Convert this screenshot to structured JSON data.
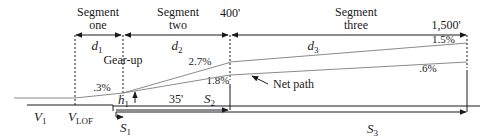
{
  "diagram": {
    "segments": [
      {
        "name": "Segment one",
        "line1": "Segment",
        "line2": "one",
        "distance": "d",
        "distance_sub": "1"
      },
      {
        "name": "Segment two",
        "line1": "Segment",
        "line2": "two",
        "distance": "d",
        "distance_sub": "2"
      },
      {
        "name": "Segment three",
        "line1": "Segment",
        "line2": "three",
        "distance": "d",
        "distance_sub": "3"
      }
    ],
    "altitudes": {
      "end_segment_two": "400'",
      "end_segment_three": "1,500'",
      "screen_height": "35'"
    },
    "gradients": {
      "ground_roll": ".3%",
      "segment_two_gross": "2.7%",
      "segment_two_net": "1.8%",
      "segment_three_gross": "1.5%",
      "segment_three_net": ".6%"
    },
    "annotations": {
      "gear_up": "Gear-up",
      "net_path": "Net path",
      "height": "h",
      "height_sub": "1"
    },
    "speeds": {
      "v1": "V",
      "v1_sub": "1",
      "vlof": "V",
      "vlof_sub": "LOF"
    },
    "distances": {
      "s1": "S",
      "s1_sub": "1",
      "s2": "S",
      "s2_sub": "2",
      "s3": "S",
      "s3_sub": "3"
    },
    "colors": {
      "line": "#1a1a1a",
      "path": "#8a8a8a"
    }
  }
}
